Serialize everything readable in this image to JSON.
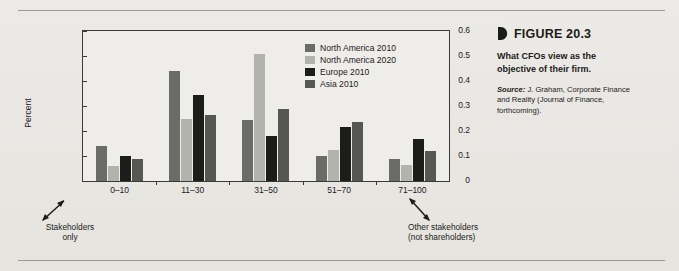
{
  "figure": {
    "bullet_icon": "right-pointing-half-disc",
    "label": "FIGURE 20.3",
    "caption": "What CFOs view as the objective of their firm.",
    "source_prefix": "Source:",
    "source_text": " J. Graham, Corporate Finance and Reality (Journal of Finance, forthcoming)."
  },
  "annotations": {
    "left_line1": "Stakeholders",
    "left_line2": "only",
    "right_line1": "Other stakeholders",
    "right_line2": "(not shareholders)",
    "left_arrow_icon": "double-headed-arrow-up-left",
    "right_arrow_icon": "double-headed-arrow-down-right"
  },
  "chart_data": {
    "type": "bar",
    "title": "",
    "xlabel": "",
    "ylabel": "Percent",
    "ylim": [
      0,
      0.6
    ],
    "yticks": [
      "0",
      "0.1",
      "0.2",
      "0.3",
      "0.4",
      "0.5",
      "0.6"
    ],
    "ytick_values": [
      0,
      0.1,
      0.2,
      0.3,
      0.4,
      0.5,
      0.6
    ],
    "grid": false,
    "legend_position": "top-right-inside",
    "categories": [
      "0–10",
      "11–30",
      "31–50",
      "51–70",
      "71–100"
    ],
    "series": [
      {
        "name": "North America 2010",
        "color": "#6b6b67",
        "values": [
          0.14,
          0.44,
          0.245,
          0.1,
          0.09
        ]
      },
      {
        "name": "North America 2020",
        "color": "#b3b3ad",
        "values": [
          0.06,
          0.25,
          0.51,
          0.125,
          0.065
        ]
      },
      {
        "name": "Europe 2010",
        "color": "#1c1c1a",
        "values": [
          0.1,
          0.345,
          0.18,
          0.215,
          0.17
        ]
      },
      {
        "name": "Asia 2010",
        "color": "#565653",
        "values": [
          0.09,
          0.265,
          0.29,
          0.235,
          0.12
        ]
      }
    ]
  }
}
